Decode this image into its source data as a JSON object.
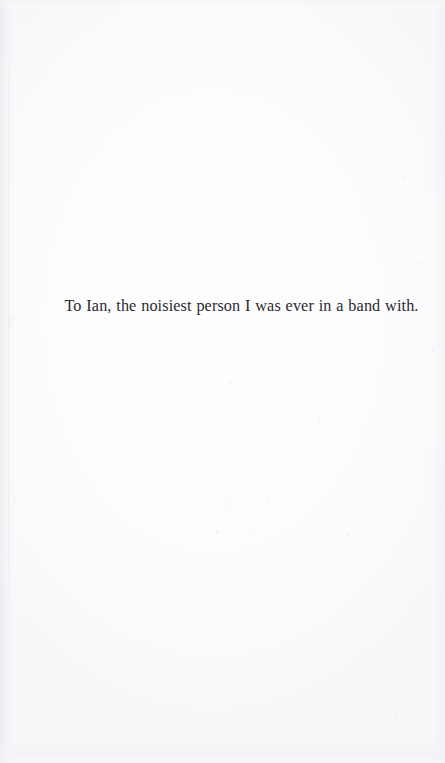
{
  "page": {
    "kind": "book-dedication-page",
    "background_color": "#fefeff",
    "text_color": "#2b2b2f",
    "page_width": 445,
    "page_height": 763
  },
  "dedication": {
    "text": "To Ian, the noisiest person I was ever in a band with."
  },
  "artifacts": {
    "specks": [
      {
        "x": 12,
        "y": 318,
        "size": 2
      },
      {
        "x": 9,
        "y": 322,
        "size": 2
      },
      {
        "x": 14,
        "y": 498,
        "size": 2
      },
      {
        "x": 7,
        "y": 556,
        "size": 2
      },
      {
        "x": 11,
        "y": 604,
        "size": 1
      },
      {
        "x": 229,
        "y": 381,
        "size": 2
      },
      {
        "x": 318,
        "y": 418,
        "size": 2
      },
      {
        "x": 186,
        "y": 459,
        "size": 1
      },
      {
        "x": 226,
        "y": 503,
        "size": 2
      },
      {
        "x": 266,
        "y": 500,
        "size": 2
      },
      {
        "x": 281,
        "y": 498,
        "size": 1
      },
      {
        "x": 216,
        "y": 531,
        "size": 2
      },
      {
        "x": 253,
        "y": 533,
        "size": 1
      },
      {
        "x": 347,
        "y": 534,
        "size": 2
      },
      {
        "x": 404,
        "y": 176,
        "size": 2
      },
      {
        "x": 418,
        "y": 262,
        "size": 2
      },
      {
        "x": 432,
        "y": 349,
        "size": 2
      },
      {
        "x": 128,
        "y": 648,
        "size": 1
      },
      {
        "x": 301,
        "y": 679,
        "size": 1
      },
      {
        "x": 395,
        "y": 712,
        "size": 2
      }
    ]
  }
}
